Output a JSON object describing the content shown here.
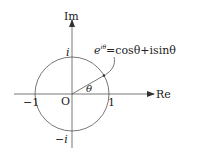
{
  "diagram": {
    "colors": {
      "stroke": "#555555",
      "text": "#222222",
      "background": "#ffffff"
    },
    "axes": {
      "real_label": "Re",
      "imag_label": "Im",
      "origin_label": "O"
    },
    "points": {
      "pos_one": "1",
      "neg_one": "−1",
      "pos_i": "i",
      "neg_i": "−i"
    },
    "angle_label": "θ",
    "formula": {
      "lhs_base": "e",
      "lhs_exp": "iθ",
      "rhs": "=cosθ+isinθ"
    }
  }
}
